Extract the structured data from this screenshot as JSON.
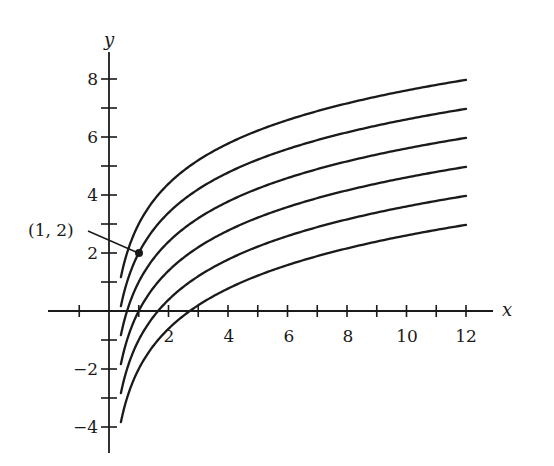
{
  "chart_data": {
    "type": "line",
    "title": "",
    "xlabel": "x",
    "ylabel": "y",
    "xlim": [
      -2,
      13
    ],
    "ylim": [
      -5,
      9
    ],
    "grid": false,
    "legend": null,
    "x_ticks": [
      -1,
      1,
      2,
      3,
      4,
      5,
      6,
      7,
      8,
      9,
      10,
      11,
      12
    ],
    "x_tick_labels": [
      {
        "value": 2,
        "label": "2"
      },
      {
        "value": 4,
        "label": "4"
      },
      {
        "value": 6,
        "label": "6"
      },
      {
        "value": 8,
        "label": "8"
      },
      {
        "value": 10,
        "label": "10"
      },
      {
        "value": 12,
        "label": "12"
      }
    ],
    "y_ticks": [
      -4,
      -3,
      -2,
      -1,
      1,
      2,
      3,
      4,
      5,
      6,
      7,
      8
    ],
    "y_tick_labels": [
      {
        "value": 8,
        "label": "8"
      },
      {
        "value": 6,
        "label": "6"
      },
      {
        "value": 4,
        "label": "4"
      },
      {
        "value": 2,
        "label": "2"
      },
      {
        "value": -2,
        "label": "-2"
      },
      {
        "value": -4,
        "label": "-4"
      }
    ],
    "x_domain": [
      0.4,
      12
    ],
    "series": [
      {
        "name": "C = 3",
        "C": 3,
        "x": [
          0.4,
          1,
          2,
          4,
          6,
          8,
          10,
          12
        ],
        "values": [
          1.17,
          3.0,
          4.39,
          5.77,
          6.58,
          7.16,
          7.61,
          7.97
        ]
      },
      {
        "name": "C = 2",
        "C": 2,
        "x": [
          0.4,
          1,
          2,
          4,
          6,
          8,
          10,
          12
        ],
        "values": [
          0.17,
          2.0,
          3.39,
          4.77,
          5.58,
          6.16,
          6.61,
          6.97
        ]
      },
      {
        "name": "C = 1",
        "C": 1,
        "x": [
          0.4,
          1,
          2,
          4,
          6,
          8,
          10,
          12
        ],
        "values": [
          -0.83,
          1.0,
          2.39,
          3.77,
          4.58,
          5.16,
          5.61,
          5.97
        ]
      },
      {
        "name": "C = 0",
        "C": 0,
        "x": [
          0.4,
          1,
          2,
          4,
          6,
          8,
          10,
          12
        ],
        "values": [
          -1.83,
          0.0,
          1.39,
          2.77,
          3.58,
          4.16,
          4.61,
          4.97
        ]
      },
      {
        "name": "C = -1",
        "C": -1,
        "x": [
          0.4,
          1,
          2,
          4,
          6,
          8,
          10,
          12
        ],
        "values": [
          -2.83,
          -1.0,
          0.39,
          1.77,
          2.58,
          3.16,
          3.61,
          3.97
        ]
      },
      {
        "name": "C = -2",
        "C": -2,
        "x": [
          0.4,
          1,
          2,
          4,
          6,
          8,
          10,
          12
        ],
        "values": [
          -3.83,
          -2.0,
          -0.61,
          0.77,
          1.58,
          2.16,
          2.61,
          2.97
        ]
      }
    ],
    "annotations": [
      {
        "text": "(1, 2)",
        "point": [
          1,
          2
        ],
        "marker": "filled-dot"
      }
    ]
  },
  "labels": {
    "x_axis": "x",
    "y_axis": "y",
    "point_annotation": "(1, 2)",
    "xt2": "2",
    "xt4": "4",
    "xt6": "6",
    "xt8": "8",
    "xt10": "10",
    "xt12": "12",
    "yt8": "8",
    "yt6": "6",
    "yt4": "4",
    "yt2": "2",
    "ytm2": "−2",
    "ytm4": "−4"
  },
  "style": {
    "ink": "#1a1a1a",
    "background": "#ffffff"
  }
}
